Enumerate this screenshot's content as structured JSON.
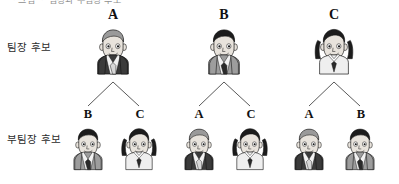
{
  "header": {
    "clipped_text": "ㆍ그림 ㆍ 팀장과 부팀장 후보"
  },
  "rows": {
    "leader_label": "팀장 후보",
    "deputy_label": "부팀장 후보"
  },
  "tree": {
    "groups": [
      {
        "leader": {
          "label": "A",
          "gender": "male",
          "hair": "gray",
          "suit": "dark"
        },
        "deputies": [
          {
            "label": "B",
            "gender": "male",
            "hair": "black",
            "suit": "medium"
          },
          {
            "label": "C",
            "gender": "female",
            "hair": "black",
            "suit": "light"
          }
        ]
      },
      {
        "leader": {
          "label": "B",
          "gender": "male",
          "hair": "black",
          "suit": "medium"
        },
        "deputies": [
          {
            "label": "A",
            "gender": "male",
            "hair": "gray",
            "suit": "dark"
          },
          {
            "label": "C",
            "gender": "female",
            "hair": "black",
            "suit": "light"
          }
        ]
      },
      {
        "leader": {
          "label": "C",
          "gender": "female",
          "hair": "black",
          "suit": "light"
        },
        "deputies": [
          {
            "label": "A",
            "gender": "male",
            "hair": "gray",
            "suit": "dark"
          },
          {
            "label": "B",
            "gender": "male",
            "hair": "black",
            "suit": "medium"
          }
        ]
      }
    ]
  },
  "colors": {
    "line": "#5a5a5a",
    "text": "#111111",
    "label_text": "#2b2b2b",
    "skin": "#e8e3dc",
    "skin_shadow": "#cfc8bf",
    "hair_black": "#1c1c1c",
    "hair_gray": "#9a9a9a",
    "suit_dark": "#3b3b3b",
    "suit_medium": "#9d9d9d",
    "suit_light": "#efefef",
    "tie_dark": "#2a2a2a",
    "tie_light": "#d8d8d8",
    "outline": "#111111"
  }
}
